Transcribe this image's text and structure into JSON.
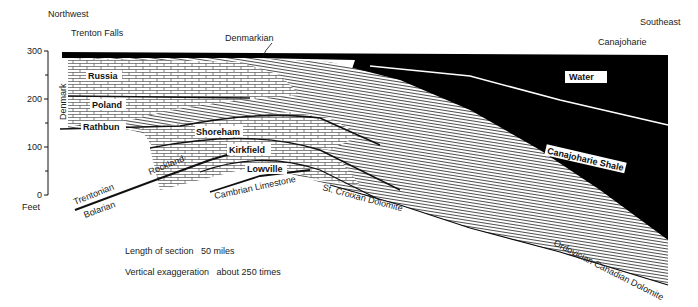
{
  "header": {
    "direction_left": "Northwest",
    "direction_right": "Southeast",
    "location_left": "Trenton Falls",
    "location_right": "Canajoharie"
  },
  "axis": {
    "unit_label": "Feet",
    "ticks": [
      "300",
      "200",
      "100",
      "0"
    ],
    "side_label": "Denmark"
  },
  "formations": {
    "top_label": "Denmarkian",
    "russia": "Russia",
    "poland": "Poland",
    "rathbun": "Rathbun",
    "shoreham": "Shoreham",
    "kirkfield": "Kirkfield",
    "lowville": "Lowville",
    "water": "Water",
    "canajoharie_shale": "Canajoharie Shale"
  },
  "base_labels": {
    "trentonian": "Trentonian",
    "bolarian": "Bolarian",
    "rockland": "Rockland",
    "cambrian_limestone": "Cambrian  Limestone",
    "st_croixan": "St. Croixan Dolomite",
    "ordovician": "Ordovician Canadian Dolomite"
  },
  "notes": {
    "length_label": "Length of section",
    "length_value": "50 miles",
    "exaggeration_label": "Vertical exaggeration",
    "exaggeration_value": "about 250 times"
  },
  "colors": {
    "shale": "#000000",
    "limestone_fill": "#ffffff",
    "line": "#111111"
  }
}
